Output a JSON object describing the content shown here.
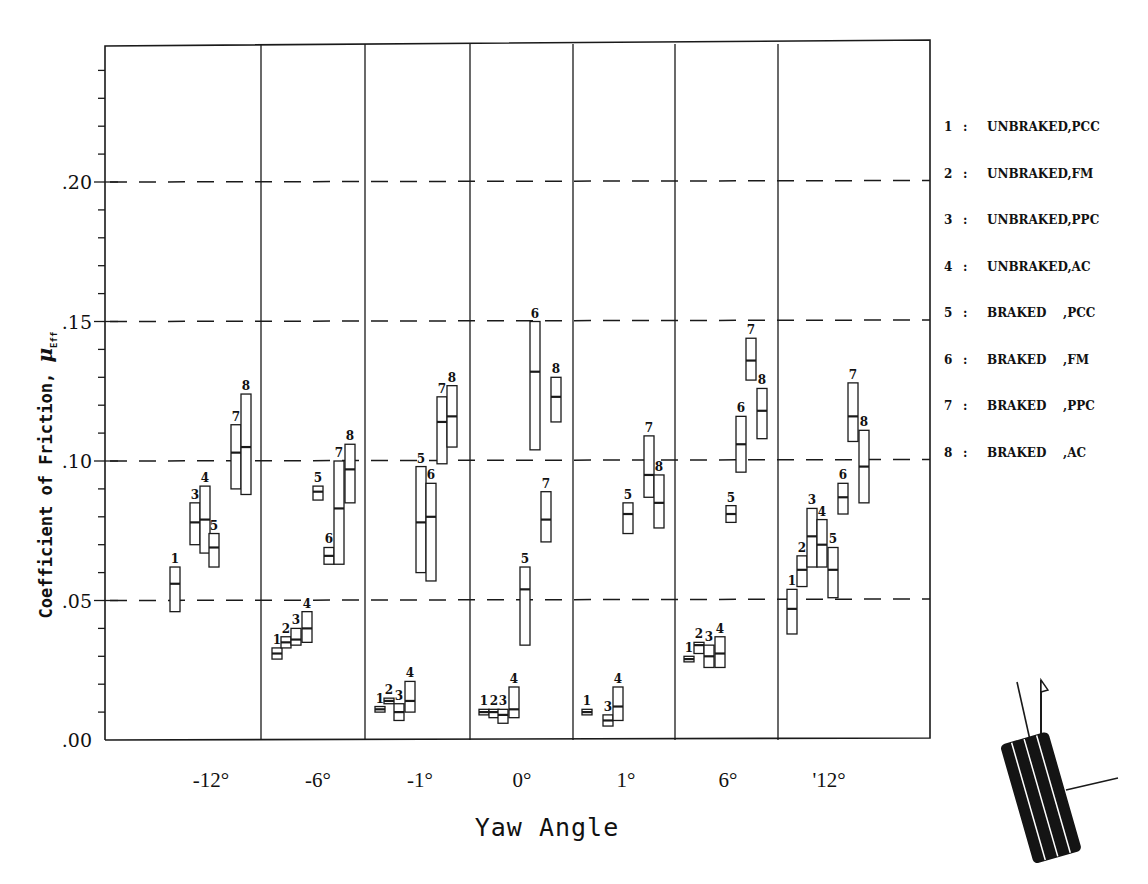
{
  "chart_data": {
    "type": "box",
    "title": "",
    "xlabel": "Yaw Angle",
    "ylabel": "Coefficient of Friction, μ",
    "ylabel_subscript": "Eff",
    "ylim": [
      0.0,
      0.25
    ],
    "yticks": [
      {
        "value": 0.0,
        "label": ".00"
      },
      {
        "value": 0.05,
        "label": ".05"
      },
      {
        "value": 0.1,
        "label": ".10"
      },
      {
        "value": 0.15,
        "label": ".15"
      },
      {
        "value": 0.2,
        "label": ".20"
      }
    ],
    "minor_tick_step": 0.01,
    "grid": {
      "dashed_horizontal_at": [
        0.05,
        0.1,
        0.15,
        0.2
      ]
    },
    "legend_position": "right",
    "legend": [
      {
        "id": "1",
        "label": "UNBRAKED,PCC",
        "sep": ":"
      },
      {
        "id": "2",
        "label": "UNBRAKED,FM",
        "sep": ":"
      },
      {
        "id": "3",
        "label": "UNBRAKED,PPC",
        "sep": ":"
      },
      {
        "id": "4",
        "label": "UNBRAKED,AC",
        "sep": ":"
      },
      {
        "id": "5",
        "label": "BRAKED    ,PCC",
        "sep": ":"
      },
      {
        "id": "6",
        "label": "BRAKED    ,FM",
        "sep": ":"
      },
      {
        "id": "7",
        "label": "BRAKED    ,PPC",
        "sep": ":"
      },
      {
        "id": "8",
        "label": "BRAKED    ,AC",
        "sep": ":"
      }
    ],
    "categories": [
      "-12°",
      "-6°",
      "-1°",
      "0°",
      "1°",
      "6°",
      "'12°"
    ],
    "groups": [
      {
        "category": "-12°",
        "boxes": [
          {
            "id": "1",
            "x": 175,
            "min": 0.046,
            "mean": 0.056,
            "max": 0.062
          },
          {
            "id": "3",
            "x": 195,
            "min": 0.07,
            "mean": 0.078,
            "max": 0.085
          },
          {
            "id": "4",
            "x": 205,
            "min": 0.067,
            "mean": 0.079,
            "max": 0.091
          },
          {
            "id": "5",
            "x": 214,
            "min": 0.062,
            "mean": 0.069,
            "max": 0.074
          },
          {
            "id": "7",
            "x": 236,
            "min": 0.09,
            "mean": 0.103,
            "max": 0.113
          },
          {
            "id": "8",
            "x": 246,
            "min": 0.088,
            "mean": 0.105,
            "max": 0.124
          }
        ]
      },
      {
        "category": "-6°",
        "boxes": [
          {
            "id": "1",
            "x": 277,
            "min": 0.029,
            "mean": 0.031,
            "max": 0.033
          },
          {
            "id": "2",
            "x": 286,
            "min": 0.033,
            "mean": 0.035,
            "max": 0.037
          },
          {
            "id": "3",
            "x": 296,
            "min": 0.034,
            "mean": 0.036,
            "max": 0.04
          },
          {
            "id": "4",
            "x": 307,
            "min": 0.035,
            "mean": 0.04,
            "max": 0.046
          },
          {
            "id": "5",
            "x": 318,
            "min": 0.086,
            "mean": 0.089,
            "max": 0.091
          },
          {
            "id": "6",
            "x": 329,
            "min": 0.063,
            "mean": 0.066,
            "max": 0.069
          },
          {
            "id": "7",
            "x": 339,
            "min": 0.063,
            "mean": 0.083,
            "max": 0.1
          },
          {
            "id": "8",
            "x": 350,
            "min": 0.085,
            "mean": 0.097,
            "max": 0.106
          }
        ]
      },
      {
        "category": "-1°",
        "boxes": [
          {
            "id": "1",
            "x": 380,
            "min": 0.01,
            "mean": 0.011,
            "max": 0.012
          },
          {
            "id": "2",
            "x": 389,
            "min": 0.013,
            "mean": 0.014,
            "max": 0.015
          },
          {
            "id": "3",
            "x": 399,
            "min": 0.007,
            "mean": 0.01,
            "max": 0.013
          },
          {
            "id": "4",
            "x": 410,
            "min": 0.01,
            "mean": 0.014,
            "max": 0.021
          },
          {
            "id": "5",
            "x": 421,
            "min": 0.06,
            "mean": 0.078,
            "max": 0.098
          },
          {
            "id": "6",
            "x": 431,
            "min": 0.057,
            "mean": 0.08,
            "max": 0.092
          },
          {
            "id": "7",
            "x": 442,
            "min": 0.099,
            "mean": 0.114,
            "max": 0.123
          },
          {
            "id": "8",
            "x": 452,
            "min": 0.105,
            "mean": 0.116,
            "max": 0.127
          }
        ]
      },
      {
        "category": "0°",
        "boxes": [
          {
            "id": "1",
            "x": 484,
            "min": 0.009,
            "mean": 0.01,
            "max": 0.011
          },
          {
            "id": "2",
            "x": 494,
            "min": 0.008,
            "mean": 0.01,
            "max": 0.011
          },
          {
            "id": "3",
            "x": 503,
            "min": 0.006,
            "mean": 0.009,
            "max": 0.011
          },
          {
            "id": "4",
            "x": 514,
            "min": 0.008,
            "mean": 0.011,
            "max": 0.019
          },
          {
            "id": "5",
            "x": 525,
            "min": 0.034,
            "mean": 0.054,
            "max": 0.062
          },
          {
            "id": "6",
            "x": 535,
            "min": 0.104,
            "mean": 0.132,
            "max": 0.15
          },
          {
            "id": "7",
            "x": 546,
            "min": 0.071,
            "mean": 0.079,
            "max": 0.089
          },
          {
            "id": "8",
            "x": 556,
            "min": 0.114,
            "mean": 0.123,
            "max": 0.13
          }
        ]
      },
      {
        "category": "1°",
        "boxes": [
          {
            "id": "1",
            "x": 587,
            "min": 0.009,
            "mean": 0.01,
            "max": 0.011
          },
          {
            "id": "3",
            "x": 608,
            "min": 0.005,
            "mean": 0.007,
            "max": 0.009
          },
          {
            "id": "4",
            "x": 618,
            "min": 0.007,
            "mean": 0.012,
            "max": 0.019
          },
          {
            "id": "5",
            "x": 628,
            "min": 0.074,
            "mean": 0.081,
            "max": 0.085
          },
          {
            "id": "7",
            "x": 649,
            "min": 0.087,
            "mean": 0.095,
            "max": 0.109
          },
          {
            "id": "8",
            "x": 659,
            "min": 0.076,
            "mean": 0.085,
            "max": 0.095
          }
        ]
      },
      {
        "category": "6°",
        "boxes": [
          {
            "id": "1",
            "x": 689,
            "min": 0.028,
            "mean": 0.029,
            "max": 0.03
          },
          {
            "id": "2",
            "x": 699,
            "min": 0.031,
            "mean": 0.034,
            "max": 0.035
          },
          {
            "id": "3",
            "x": 709,
            "min": 0.026,
            "mean": 0.03,
            "max": 0.034
          },
          {
            "id": "4",
            "x": 720,
            "min": 0.026,
            "mean": 0.031,
            "max": 0.037
          },
          {
            "id": "5",
            "x": 731,
            "min": 0.078,
            "mean": 0.081,
            "max": 0.084
          },
          {
            "id": "6",
            "x": 741,
            "min": 0.096,
            "mean": 0.106,
            "max": 0.116
          },
          {
            "id": "7",
            "x": 751,
            "min": 0.129,
            "mean": 0.136,
            "max": 0.144
          },
          {
            "id": "8",
            "x": 762,
            "min": 0.108,
            "mean": 0.118,
            "max": 0.126
          }
        ]
      },
      {
        "category": "'12°",
        "boxes": [
          {
            "id": "1",
            "x": 792,
            "min": 0.038,
            "mean": 0.047,
            "max": 0.054
          },
          {
            "id": "2",
            "x": 802,
            "min": 0.055,
            "mean": 0.061,
            "max": 0.066
          },
          {
            "id": "3",
            "x": 812,
            "min": 0.062,
            "mean": 0.073,
            "max": 0.083
          },
          {
            "id": "4",
            "x": 822,
            "min": 0.062,
            "mean": 0.07,
            "max": 0.079
          },
          {
            "id": "5",
            "x": 833,
            "min": 0.051,
            "mean": 0.061,
            "max": 0.069
          },
          {
            "id": "6",
            "x": 843,
            "min": 0.081,
            "mean": 0.087,
            "max": 0.092
          },
          {
            "id": "7",
            "x": 853,
            "min": 0.107,
            "mean": 0.116,
            "max": 0.128
          },
          {
            "id": "8",
            "x": 864,
            "min": 0.085,
            "mean": 0.098,
            "max": 0.111
          }
        ]
      }
    ]
  },
  "axis": {
    "xlabel": "Yaw Angle",
    "ylabel_main": "Coefficient of Friction, ",
    "ylabel_mu": "μ",
    "ylabel_sub": "Eff"
  },
  "icons": {
    "tire": "tire-yaw-diagram-icon"
  }
}
